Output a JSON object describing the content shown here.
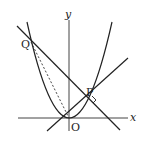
{
  "diagram": {
    "type": "coordinate-geometry",
    "labels": {
      "x_axis": "x",
      "y_axis": "y",
      "origin": "O",
      "point_p": "P",
      "point_q": "Q"
    },
    "elements": [
      {
        "kind": "axis",
        "name": "x-axis"
      },
      {
        "kind": "axis",
        "name": "y-axis"
      },
      {
        "kind": "curve",
        "name": "parabola",
        "shape": "upward parabola with vertex at O"
      },
      {
        "kind": "line",
        "name": "line-OP",
        "through": [
          "O",
          "P"
        ]
      },
      {
        "kind": "line",
        "name": "line-QP",
        "through": [
          "Q",
          "P"
        ],
        "perpendicular_to": "line-OP"
      },
      {
        "kind": "segment",
        "name": "segment-QO",
        "style": "dashed"
      },
      {
        "kind": "marker",
        "name": "right-angle-marker",
        "at": "P"
      }
    ],
    "colors": {
      "stroke": "#222222",
      "axis": "#444444",
      "background": "#ffffff"
    }
  }
}
